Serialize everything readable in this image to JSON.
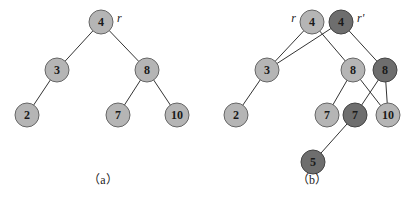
{
  "colors": {
    "light_node": "#b5b5b5",
    "dark_node": "#6e6e6e",
    "edge": "#333333"
  },
  "panels": [
    {
      "caption": "（a）",
      "nodes": [
        {
          "id": "a4",
          "value": "4",
          "x": 101,
          "y": 22,
          "style": "light",
          "tag": "r"
        },
        {
          "id": "a3",
          "value": "3",
          "x": 57,
          "y": 70,
          "style": "light"
        },
        {
          "id": "a8",
          "value": "8",
          "x": 147,
          "y": 70,
          "style": "light"
        },
        {
          "id": "a2",
          "value": "2",
          "x": 27,
          "y": 115,
          "style": "light"
        },
        {
          "id": "a7",
          "value": "7",
          "x": 118,
          "y": 115,
          "style": "light"
        },
        {
          "id": "a10",
          "value": "10",
          "x": 177,
          "y": 115,
          "style": "light"
        }
      ],
      "edges": [
        [
          "a4",
          "a3"
        ],
        [
          "a4",
          "a8"
        ],
        [
          "a3",
          "a2"
        ],
        [
          "a8",
          "a7"
        ],
        [
          "a8",
          "a10"
        ]
      ]
    },
    {
      "caption": "（b）",
      "nodes": [
        {
          "id": "b4",
          "value": "4",
          "x": 312,
          "y": 22,
          "style": "light",
          "tag": "r"
        },
        {
          "id": "b4p",
          "value": "4",
          "x": 341,
          "y": 22,
          "style": "dark",
          "tag": "r'"
        },
        {
          "id": "b3",
          "value": "3",
          "x": 267,
          "y": 70,
          "style": "light"
        },
        {
          "id": "b8",
          "value": "8",
          "x": 353,
          "y": 70,
          "style": "light"
        },
        {
          "id": "b8p",
          "value": "8",
          "x": 385,
          "y": 70,
          "style": "dark"
        },
        {
          "id": "b2",
          "value": "2",
          "x": 236,
          "y": 115,
          "style": "light"
        },
        {
          "id": "b7",
          "value": "7",
          "x": 327,
          "y": 115,
          "style": "light"
        },
        {
          "id": "b7p",
          "value": "7",
          "x": 355,
          "y": 115,
          "style": "dark"
        },
        {
          "id": "b10",
          "value": "10",
          "x": 388,
          "y": 115,
          "style": "light"
        },
        {
          "id": "b5",
          "value": "5",
          "x": 313,
          "y": 162,
          "style": "dark"
        }
      ],
      "edges": [
        [
          "b4",
          "b3"
        ],
        [
          "b4",
          "b8"
        ],
        [
          "b4p",
          "b3"
        ],
        [
          "b4p",
          "b8p"
        ],
        [
          "b3",
          "b2"
        ],
        [
          "b8",
          "b7"
        ],
        [
          "b8",
          "b10"
        ],
        [
          "b8p",
          "b7p"
        ],
        [
          "b8p",
          "b10"
        ],
        [
          "b7p",
          "b5"
        ]
      ]
    }
  ],
  "labels": {
    "a_root_tag": "r",
    "b_root_tag": "r",
    "b_new_root_tag": "r'",
    "caption_a": "（a）",
    "caption_b": "（b）",
    "a4": "4",
    "a3": "3",
    "a8": "8",
    "a2": "2",
    "a7": "7",
    "a10": "10",
    "b4": "4",
    "b4p": "4",
    "b3": "3",
    "b8": "8",
    "b8p": "8",
    "b2": "2",
    "b7": "7",
    "b7p": "7",
    "b10": "10",
    "b5": "5"
  }
}
